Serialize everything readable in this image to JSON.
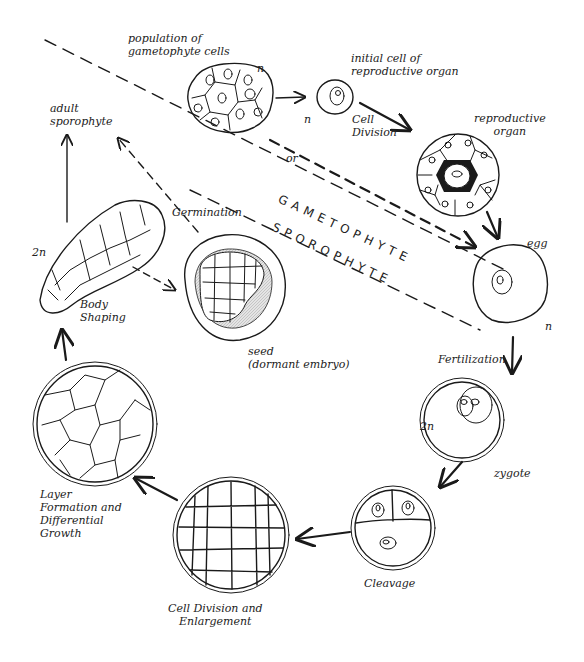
{
  "regions": {
    "upper": "GAMETOPHYTE",
    "lower": "SPOROPHYTE"
  },
  "stages": {
    "gametophyte_population": {
      "label": "population of\ngametophyte cells",
      "ploidy": "n"
    },
    "initial_cell": {
      "label": "initial cell of\nreproductive organ",
      "ploidy": "n"
    },
    "reproductive_organ": {
      "label": "reproductive\norgan"
    },
    "egg": {
      "label": "egg",
      "ploidy": "n"
    },
    "zygote": {
      "label": "zygote",
      "ploidy": "2n"
    },
    "cleavage": {
      "label": "Cleavage"
    },
    "cell_division": {
      "label": "Cell Division and\nEnlargement"
    },
    "layer_formation": {
      "label": "Layer\nFormation and\nDifferential\nGrowth"
    },
    "body_shaping": {
      "label": "Body\nShaping",
      "ploidy": "2n"
    },
    "adult_sporophyte": {
      "label": "adult\nsporophyte"
    },
    "seed": {
      "label": "seed\n(dormant embryo)"
    }
  },
  "transitions": {
    "cell_division": "Cell\nDivision",
    "or": "or",
    "fertilization": "Fertilization",
    "germination": "Germination"
  },
  "colors": {
    "ink": "#1a1a1a",
    "background": "#ffffff",
    "seed_coat_shading": "#cfcfcf"
  }
}
